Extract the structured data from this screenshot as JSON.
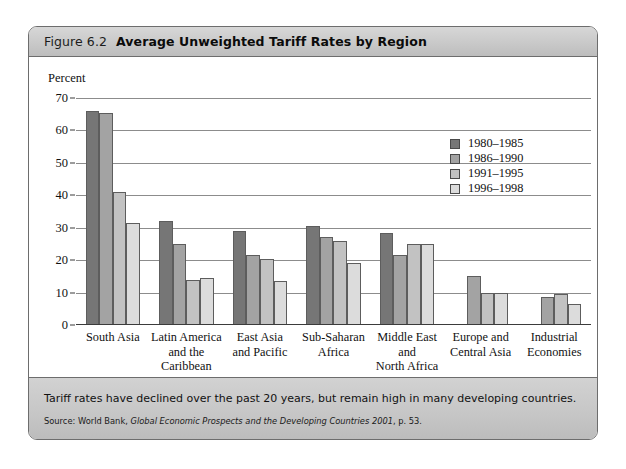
{
  "header": {
    "figure_number": "Figure 6.2",
    "title": "Average Unweighted Tariff Rates by Region"
  },
  "footer": {
    "caption": "Tariff rates have declined over the past 20 years, but remain high in many developing countries.",
    "source_prefix": "Source: World Bank,",
    "source_italic": "Global Economic Prospects and the Developing Countries 2001",
    "source_suffix": ", p. 53."
  },
  "chart_data": {
    "type": "bar",
    "title": "Average Unweighted Tariff Rates by Region",
    "xlabel": "",
    "ylabel": "Percent",
    "ylim": [
      0,
      70
    ],
    "yticks": [
      0,
      10,
      20,
      30,
      40,
      50,
      60,
      70
    ],
    "grid": true,
    "legend_position": "top-right",
    "categories": [
      "South Asia",
      "Latin America and the Caribbean",
      "East Asia and Pacific",
      "Sub-Saharan Africa",
      "Middle East and North Africa",
      "Europe and Central Asia",
      "Industrial Economies"
    ],
    "category_lines": [
      [
        "South Asia"
      ],
      [
        "Latin America",
        "and the",
        "Caribbean"
      ],
      [
        "East Asia",
        "and Pacific"
      ],
      [
        "Sub-Saharan",
        "Africa"
      ],
      [
        "Middle East",
        "and",
        "North Africa"
      ],
      [
        "Europe and",
        "Central Asia"
      ],
      [
        "Industrial",
        "Economies"
      ]
    ],
    "series": [
      {
        "name": "1980–1985",
        "color": "#767676",
        "values": [
          66,
          32,
          29,
          30.5,
          28.5,
          null,
          null
        ]
      },
      {
        "name": "1986–1990",
        "color": "#a3a3a3",
        "values": [
          65.5,
          25,
          21.5,
          27,
          21.5,
          15,
          8.5
        ]
      },
      {
        "name": "1991–1995",
        "color": "#c2c2c2",
        "values": [
          41,
          14,
          20.5,
          26,
          25,
          10,
          9.5
        ]
      },
      {
        "name": "1996–1998",
        "color": "#dcdcdc",
        "values": [
          31.5,
          14.5,
          13.5,
          19,
          25,
          10,
          6.5
        ]
      }
    ]
  }
}
